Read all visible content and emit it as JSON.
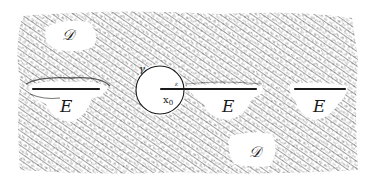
{
  "figure": {
    "colors": {
      "ink": "#1a1a1a",
      "hatch": "#4a4a4a",
      "background": "#ffffff"
    },
    "region_bounds": {
      "x": 18,
      "y": 10,
      "width": 340,
      "height": 165
    },
    "labels": {
      "D_top": "𝒟",
      "D_bottom": "𝒟",
      "E_left": "E",
      "E_middle": "E",
      "E_right": "E",
      "gamma": "γ",
      "x0_main": "x",
      "x0_sub": "0",
      "radius": "ε"
    },
    "circle": {
      "cx": 160,
      "cy": 90,
      "r": 24
    },
    "segments": [
      {
        "name": "E-left",
        "x1": 33,
        "y1": 89,
        "x2": 99,
        "y2": 89
      },
      {
        "name": "E-middle",
        "x1": 161,
        "y1": 89,
        "x2": 256,
        "y2": 89
      },
      {
        "name": "E-right",
        "x1": 295,
        "y1": 89,
        "x2": 345,
        "y2": 89
      }
    ]
  }
}
